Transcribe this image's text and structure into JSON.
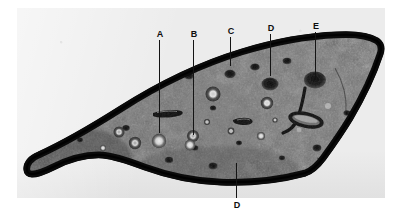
{
  "figure": {
    "kind": "micrograph-plate",
    "caption": "",
    "plate_background": "#ececec",
    "ink_color": "#141414",
    "page_background": "#ffffff"
  },
  "annotations": [
    {
      "id": "label-a",
      "letter": "A",
      "label_x": 155,
      "label_y": 30,
      "line_x": 159,
      "line_top": 40,
      "line_bottom": 133,
      "target": "bright-vascular-bundle"
    },
    {
      "id": "label-b",
      "letter": "B",
      "label_x": 189,
      "label_y": 30,
      "line_x": 193,
      "line_top": 40,
      "line_bottom": 135,
      "target": "ringed-vascular-bundle"
    },
    {
      "id": "label-c",
      "letter": "C",
      "label_x": 226,
      "label_y": 27,
      "line_x": 230,
      "line_top": 37,
      "line_bottom": 66,
      "target": "small-dark-cavity"
    },
    {
      "id": "label-d-top",
      "letter": "D",
      "label_x": 266,
      "label_y": 24,
      "line_x": 270,
      "line_top": 34,
      "line_bottom": 76,
      "target": "dark-resin-duct-upper"
    },
    {
      "id": "label-e",
      "letter": "E",
      "label_x": 311,
      "label_y": 22,
      "line_x": 315,
      "line_top": 32,
      "line_bottom": 80,
      "target": "large-dark-cavity"
    },
    {
      "id": "label-d-bottom",
      "letter": "D",
      "label_x": 232,
      "label_y": 201,
      "line_x": 236,
      "line_top": 163,
      "line_bottom": 198,
      "target": "dark-resin-duct-lower"
    }
  ],
  "features": {
    "outline_name": "specimen-cross-section",
    "cortex_name": "dark-cortex-rind",
    "ground_tissue_name": "ground-tissue",
    "hooked_cavity_name": "hooked-cavity",
    "elongated_cavity_name": "elongated-cavity"
  }
}
